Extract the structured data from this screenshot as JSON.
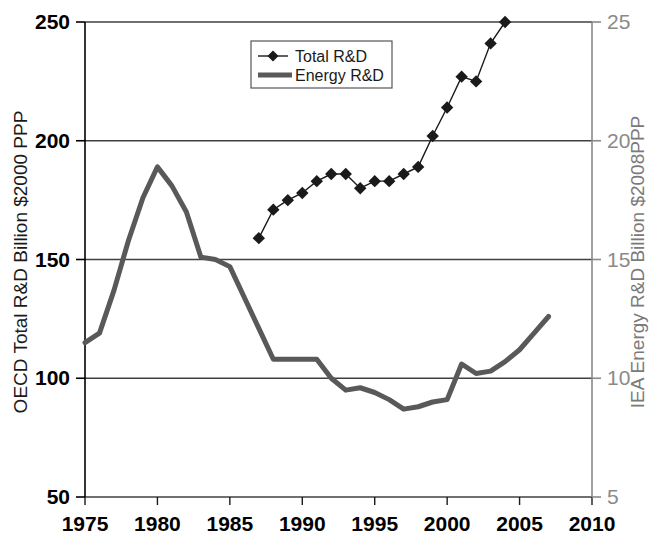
{
  "chart_data": {
    "type": "line",
    "title": "",
    "subtitle": "",
    "xlabel": "",
    "ylabel": "OECD Total R&D Billion $2000 PPP",
    "ylabel_right": "IEA Energy R&D Billion $2008PPP",
    "xlim": [
      1975,
      2010
    ],
    "ylim": [
      50,
      250
    ],
    "ylim_right": [
      5,
      25
    ],
    "xticks": [
      1975,
      1980,
      1985,
      1990,
      1995,
      2000,
      2005,
      2010
    ],
    "xtick_labels": [
      "1975",
      "1980",
      "1985",
      "1990",
      "1995",
      "2000",
      "2005",
      "2010"
    ],
    "yticks": [
      50,
      100,
      150,
      200,
      250
    ],
    "ytick_labels": [
      "50",
      "100",
      "150",
      "200",
      "250"
    ],
    "yticks_right": [
      5,
      10,
      15,
      20,
      25
    ],
    "ytick_labels_right": [
      "5",
      "10",
      "15",
      "20",
      "25"
    ],
    "grid": true,
    "grid_axis": "y",
    "legend_position": "upper center",
    "series": [
      {
        "name": "Total R&D",
        "axis": "left",
        "marker": "diamond",
        "color": "#1a1a1a",
        "x": [
          1987,
          1988,
          1989,
          1990,
          1991,
          1992,
          1993,
          1994,
          1995,
          1996,
          1997,
          1998,
          1999,
          2000,
          2001,
          2002,
          2003,
          2004
        ],
        "values": [
          159,
          171,
          175,
          178,
          183,
          186,
          186,
          180,
          183,
          183,
          186,
          189,
          202,
          214,
          227,
          225,
          241,
          250
        ]
      },
      {
        "name": "Energy R&D",
        "axis": "right",
        "marker": "none",
        "color": "#595959",
        "x": [
          1975,
          1976,
          1977,
          1978,
          1979,
          1980,
          1981,
          1982,
          1983,
          1984,
          1985,
          1986,
          1987,
          1988,
          1989,
          1990,
          1991,
          1992,
          1993,
          1994,
          1995,
          1996,
          1997,
          1998,
          1999,
          2000,
          2001,
          2002,
          2003,
          2004,
          2005,
          2006,
          2007
        ],
        "values_left_scale": [
          115,
          119,
          137,
          158,
          176,
          189,
          181,
          170,
          151,
          150,
          147,
          134,
          121,
          108,
          108,
          108,
          108,
          100,
          95,
          96,
          94,
          91,
          87,
          88,
          90,
          91,
          106,
          102,
          103,
          107,
          112,
          119,
          126
        ],
        "values_right_scale": [
          11.5,
          11.9,
          13.7,
          15.8,
          17.6,
          18.9,
          18.1,
          17.0,
          15.1,
          15.0,
          14.7,
          13.4,
          12.1,
          10.8,
          10.8,
          10.8,
          10.8,
          10.0,
          9.5,
          9.6,
          9.4,
          9.1,
          8.7,
          8.8,
          9.0,
          9.1,
          10.6,
          10.2,
          10.3,
          10.7,
          11.2,
          11.9,
          12.6
        ]
      }
    ]
  },
  "legend": {
    "items": [
      {
        "label": "Total R&D"
      },
      {
        "label": "Energy R&D"
      }
    ]
  },
  "colors": {
    "total_rd": "#1a1a1a",
    "energy_rd": "#595959",
    "axis_left": "#000000",
    "axis_right": "#8a8a8a",
    "grid": "#404040",
    "background": "#ffffff"
  }
}
